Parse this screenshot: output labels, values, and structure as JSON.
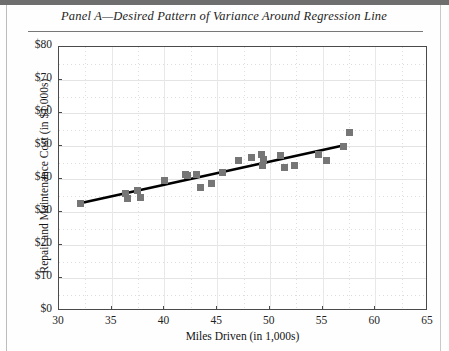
{
  "figure": {
    "panel_title": "Panel A—Desired Pattern of Variance Around Regression Line"
  },
  "chart_data": {
    "type": "scatter",
    "title": "Panel A—Desired Pattern of Variance Around Regression Line",
    "xlabel": "Miles Driven (in 1,000s)",
    "ylabel": "Repair and Maintenance Cost (in $1,000s)",
    "xlim": [
      30,
      65
    ],
    "ylim": [
      0,
      80
    ],
    "xticks": [
      30,
      35,
      40,
      45,
      50,
      55,
      60,
      65
    ],
    "xtick_labels": [
      "30",
      "35",
      "40",
      "45",
      "50",
      "55",
      "60",
      "65"
    ],
    "yticks": [
      0,
      10,
      20,
      30,
      40,
      50,
      60,
      70,
      80
    ],
    "ytick_labels": [
      "$0",
      "$10",
      "$20",
      "$30",
      "$40",
      "$50",
      "$60",
      "$70",
      "$80"
    ],
    "grid": true,
    "legend": null,
    "marker_color": "#767676",
    "marker_shape": "square",
    "line_color": "#000000",
    "series": [
      {
        "name": "Repair and maintenance cost",
        "points": [
          {
            "x": 32.0,
            "y": 32.5
          },
          {
            "x": 36.3,
            "y": 35.5
          },
          {
            "x": 36.5,
            "y": 34.0
          },
          {
            "x": 37.4,
            "y": 36.5
          },
          {
            "x": 37.7,
            "y": 34.5
          },
          {
            "x": 40.0,
            "y": 39.5
          },
          {
            "x": 42.0,
            "y": 41.5
          },
          {
            "x": 42.2,
            "y": 41.0
          },
          {
            "x": 43.0,
            "y": 41.5
          },
          {
            "x": 43.4,
            "y": 37.5
          },
          {
            "x": 44.5,
            "y": 38.5
          },
          {
            "x": 45.5,
            "y": 42.0
          },
          {
            "x": 47.0,
            "y": 45.5
          },
          {
            "x": 48.3,
            "y": 46.5
          },
          {
            "x": 49.2,
            "y": 47.5
          },
          {
            "x": 49.3,
            "y": 44.0
          },
          {
            "x": 49.4,
            "y": 46.0
          },
          {
            "x": 51.0,
            "y": 47.0
          },
          {
            "x": 51.4,
            "y": 43.5
          },
          {
            "x": 52.3,
            "y": 44.0
          },
          {
            "x": 54.6,
            "y": 47.5
          },
          {
            "x": 55.4,
            "y": 45.5
          },
          {
            "x": 57.0,
            "y": 50.0
          },
          {
            "x": 57.6,
            "y": 54.0
          }
        ]
      }
    ],
    "trendline": {
      "name": "Regression line",
      "x_start": 32.0,
      "y_start": 32.3,
      "x_end": 57.2,
      "y_end": 50.0
    }
  }
}
